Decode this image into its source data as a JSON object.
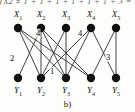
{
  "figure": {
    "caption": "b)",
    "clipped_header_text": "(X2 ≠ 1 + 1 + 1 + 1 + 1 + 1 + 3 = 1"
  },
  "chart_data": {
    "type": "diagram",
    "diagram_kind": "bipartite-graph",
    "title": "b)",
    "top_nodes": [
      {
        "id": "X1",
        "label": "X",
        "sub": "1",
        "x": 18,
        "y": 28
      },
      {
        "id": "X2",
        "label": "X",
        "sub": "2",
        "x": 41,
        "y": 28
      },
      {
        "id": "X3",
        "label": "X",
        "sub": "3",
        "x": 66,
        "y": 28
      },
      {
        "id": "X4",
        "label": "X",
        "sub": "4",
        "x": 91,
        "y": 28
      },
      {
        "id": "X5",
        "label": "X",
        "sub": "5",
        "x": 116,
        "y": 28
      }
    ],
    "bottom_nodes": [
      {
        "id": "Y1",
        "label": "Y",
        "sub": "1",
        "x": 18,
        "y": 78
      },
      {
        "id": "Y2",
        "label": "Y",
        "sub": "2",
        "x": 41,
        "y": 78
      },
      {
        "id": "Y3",
        "label": "Y",
        "sub": "3",
        "x": 66,
        "y": 78
      },
      {
        "id": "Y4",
        "label": "Y",
        "sub": "4",
        "x": 91,
        "y": 78
      },
      {
        "id": "Y5",
        "label": "Y",
        "sub": "5",
        "x": 116,
        "y": 78
      }
    ],
    "edges": [
      {
        "from": "X1",
        "to": "Y2"
      },
      {
        "from": "X1",
        "to": "Y3"
      },
      {
        "from": "X1",
        "to": "Y4"
      },
      {
        "from": "X2",
        "to": "Y1"
      },
      {
        "from": "X2",
        "to": "Y2"
      },
      {
        "from": "X2",
        "to": "Y3"
      },
      {
        "from": "X2",
        "to": "Y4"
      },
      {
        "from": "X3",
        "to": "Y2"
      },
      {
        "from": "X3",
        "to": "Y3"
      },
      {
        "from": "X4",
        "to": "Y2"
      },
      {
        "from": "X4",
        "to": "Y3"
      },
      {
        "from": "X5",
        "to": "Y5"
      },
      {
        "from": "X4",
        "to": "Y5"
      },
      {
        "from": "X5",
        "to": "Y4"
      }
    ],
    "edge_weights": [
      {
        "value": "4",
        "x": 38,
        "y": 33
      },
      {
        "value": "4",
        "x": 80,
        "y": 33
      },
      {
        "value": "2",
        "x": 12,
        "y": 58
      },
      {
        "value": "1",
        "x": 52,
        "y": 71
      },
      {
        "value": "3",
        "x": 108,
        "y": 57
      }
    ],
    "node_radius": 4.2,
    "node_color": "#111111",
    "edge_color": "#2d2d2d",
    "background": "#fdfdfb"
  }
}
